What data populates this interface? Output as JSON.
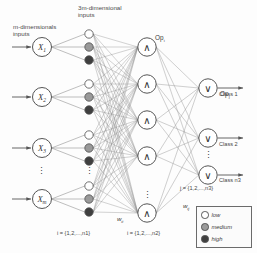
{
  "diagram": {
    "labels": {
      "input_header": "m-dimensionals\ninputs",
      "fuzzified_header": "3m-dimensional\ninputs",
      "op_and_top": "Op",
      "op_and_top_sub": "i",
      "op_or_top": "Op",
      "op_or_top_sub": "j",
      "weight_w1": "w",
      "weight_w1_sub": "ii",
      "weight_w2": "w",
      "weight_w2_sub": "ij",
      "index_layer1": "i = {1,2,...,n1}",
      "index_layer2": "i = {1,2,...,n2}",
      "index_layer3": "j = {1,2,...,n3}"
    },
    "input_nodes": [
      {
        "label": "X",
        "sub": "1"
      },
      {
        "label": "X",
        "sub": "2"
      },
      {
        "label": "X",
        "sub": "3"
      },
      {
        "label": "X",
        "sub": "m"
      }
    ],
    "input_ellipsis": "⋮",
    "fuzzy_sets": [
      {
        "name": "low",
        "color": "#ffffff"
      },
      {
        "name": "medium",
        "color": "#9a9a9a"
      },
      {
        "name": "high",
        "color": "#3f3f3f"
      }
    ],
    "and_layer": {
      "glyph": "∧",
      "node_count_visible": 5,
      "ellipsis": "⋮"
    },
    "or_layer": {
      "glyph": "∨",
      "node_count_visible": 3,
      "ellipsis": "⋮",
      "outputs": [
        "Class 1",
        "Class 2",
        "Class n3"
      ]
    },
    "legend": {
      "title": "",
      "items": [
        {
          "label": "low",
          "color": "#ffffff"
        },
        {
          "label": "medium",
          "color": "#9a9a9a"
        },
        {
          "label": "high",
          "color": "#3f3f3f"
        }
      ]
    },
    "colors": {
      "stroke": "#555555",
      "line": "#777777",
      "text": "#3b3b3b",
      "low": "#ffffff",
      "medium": "#9a9a9a",
      "high": "#3f3f3f"
    }
  }
}
